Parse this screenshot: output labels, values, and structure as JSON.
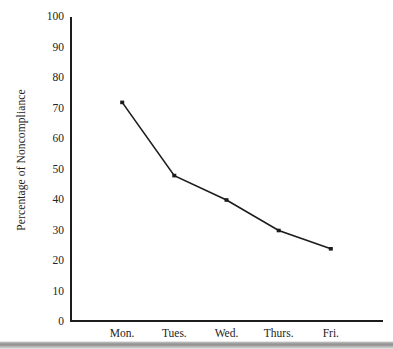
{
  "chart_data": {
    "type": "line",
    "title": "",
    "subtitle": "",
    "xlabel": "",
    "ylabel": "Percentage of Noncompliance",
    "categories": [
      "Mon.",
      "Tues.",
      "Wed.",
      "Thurs.",
      "Fri."
    ],
    "values": [
      72,
      48,
      40,
      30,
      24
    ],
    "series": [
      {
        "name": "Percentage of Noncompliance",
        "values": [
          72,
          48,
          40,
          30,
          24
        ]
      }
    ],
    "ylim": [
      0,
      100
    ],
    "yticks": [
      0,
      10,
      20,
      30,
      40,
      50,
      60,
      70,
      80,
      90,
      100
    ],
    "ytick_labels": [
      "0",
      "10",
      "20",
      "30",
      "40",
      "50",
      "60",
      "70",
      "80",
      "90",
      "100"
    ],
    "grid": false,
    "legend": false,
    "legend_position": "none",
    "marker": "square",
    "line_color": "#1c1c1c",
    "marker_color": "#1c1c1c",
    "axis_color": "#1c1c1c",
    "background_color": "#ffffff"
  },
  "figure": {
    "scan_band_color": "#8f8f8f"
  }
}
